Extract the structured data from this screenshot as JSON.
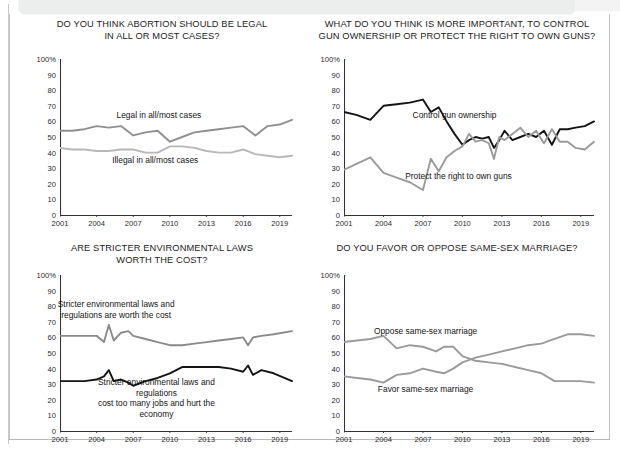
{
  "page": {
    "background_color": "#ffffff",
    "frame_color": "#c4c4c4",
    "banner_color": "#eceded"
  },
  "palette": {
    "black_series": "#141414",
    "gray_series": "#9a9a9a",
    "mid_gray_series": "#808080",
    "axis": "#333333",
    "tick_text": "#2a2a2a"
  },
  "axis": {
    "y_ticks": [
      "100%",
      "90",
      "80",
      "70",
      "60",
      "50",
      "40",
      "30",
      "20",
      "10",
      "0"
    ],
    "y_values": [
      100,
      90,
      80,
      70,
      60,
      50,
      40,
      30,
      20,
      10,
      0
    ],
    "x_ticks": [
      "2001",
      "2004",
      "2007",
      "2010",
      "2013",
      "2016",
      "2019"
    ],
    "x_values": [
      2001,
      2004,
      2007,
      2010,
      2013,
      2016,
      2019
    ]
  },
  "chart_data": [
    {
      "id": "abortion",
      "type": "line",
      "title": "DO YOU THINK ABORTION SHOULD BE LEGAL\nIN ALL OR MOST CASES?",
      "xlabel": "",
      "ylabel": "",
      "ylim": [
        0,
        100
      ],
      "xlim": [
        2001,
        2020
      ],
      "grid": false,
      "legend_position": "inline-annotation",
      "series": [
        {
          "name": "Legal in all/most cases",
          "color": "#8f8f8f",
          "label_x": 2009.1,
          "label_y": 64,
          "x": [
            2001,
            2002,
            2003,
            2004,
            2005,
            2006,
            2007,
            2008,
            2009,
            2010,
            2011,
            2012,
            2013,
            2014,
            2015,
            2016,
            2017,
            2018,
            2019,
            2020
          ],
          "y": [
            54,
            54,
            55,
            57,
            56,
            57,
            51,
            53,
            54,
            47,
            50,
            53,
            54,
            55,
            56,
            57,
            51,
            57,
            58,
            61
          ]
        },
        {
          "name": "Illegal in all/most cases",
          "color": "#b8b8b8",
          "label_x": 2008.8,
          "label_y": 35,
          "x": [
            2001,
            2002,
            2003,
            2004,
            2005,
            2006,
            2007,
            2008,
            2009,
            2010,
            2011,
            2012,
            2013,
            2014,
            2015,
            2016,
            2017,
            2018,
            2019,
            2020
          ],
          "y": [
            43,
            42,
            42,
            41,
            41,
            42,
            42,
            40,
            40,
            44,
            44,
            43,
            41,
            40,
            40,
            42,
            39,
            38,
            37,
            38
          ]
        }
      ]
    },
    {
      "id": "guns",
      "type": "line",
      "title": "WHAT DO YOU THINK IS MORE IMPORTANT, TO CONTROL\nGUN OWNERSHIP OR PROTECT THE RIGHT TO OWN GUNS?",
      "xlabel": "",
      "ylabel": "",
      "ylim": [
        0,
        100
      ],
      "xlim": [
        2001,
        2020
      ],
      "grid": false,
      "legend_position": "inline-annotation",
      "series": [
        {
          "name": "Control gun ownership",
          "color": "#141414",
          "label_x": 2009.4,
          "label_y": 64,
          "x": [
            2001,
            2002,
            2003,
            2004,
            2005,
            2006,
            2007,
            2007.6,
            2008.2,
            2008.8,
            2009.4,
            2010,
            2010.5,
            2011,
            2011.5,
            2012,
            2012.4,
            2012.8,
            2013.2,
            2013.8,
            2014.4,
            2015,
            2015.6,
            2016.2,
            2016.8,
            2017.4,
            2018,
            2018.6,
            2019.3,
            2020
          ],
          "y": [
            66,
            64,
            61,
            70,
            71,
            72,
            74,
            66,
            69,
            60,
            52,
            45,
            48,
            50,
            49,
            50,
            43,
            48,
            54,
            48,
            50,
            52,
            50,
            54,
            45,
            55,
            55,
            56,
            57,
            60
          ]
        },
        {
          "name": "Protect the right to own guns",
          "color": "#9a9a9a",
          "label_x": 2009.7,
          "label_y": 25,
          "x": [
            2001,
            2002,
            2003,
            2004,
            2005,
            2006,
            2007,
            2007.6,
            2008.2,
            2008.8,
            2009.4,
            2010,
            2010.5,
            2011,
            2011.5,
            2012,
            2012.4,
            2012.8,
            2013.2,
            2013.8,
            2014.4,
            2015,
            2015.6,
            2016.2,
            2016.8,
            2017.4,
            2018,
            2018.6,
            2019.3,
            2020
          ],
          "y": [
            29,
            33,
            37,
            27,
            24,
            21,
            16,
            36,
            28,
            37,
            41,
            44,
            52,
            47,
            48,
            46,
            36,
            50,
            48,
            52,
            56,
            50,
            54,
            46,
            55,
            47,
            47,
            43,
            42,
            47
          ]
        }
      ]
    },
    {
      "id": "environment",
      "type": "line",
      "title": "ARE STRICTER ENVIRONMENTAL LAWS\nWORTH THE COST?",
      "xlabel": "",
      "ylabel": "",
      "ylim": [
        0,
        100
      ],
      "xlim": [
        2001,
        2020
      ],
      "grid": false,
      "legend_position": "inline-annotation",
      "series": [
        {
          "name": "Stricter environmental laws and\nregulations are worth the cost",
          "color": "#8a8a8a",
          "label_x": 2005.6,
          "label_y": 78,
          "x": [
            2001,
            2002,
            2003,
            2004,
            2004.6,
            2005,
            2005.4,
            2006,
            2006.6,
            2007,
            2008,
            2009,
            2010,
            2011,
            2012,
            2013,
            2014,
            2015,
            2016,
            2016.4,
            2016.8,
            2017.5,
            2018.5,
            2020
          ],
          "y": [
            61,
            61,
            61,
            61,
            57,
            68,
            58,
            63,
            64,
            61,
            59,
            57,
            55,
            55,
            56,
            57,
            58,
            59,
            60,
            55,
            60,
            61,
            62,
            64
          ]
        },
        {
          "name": "Stricter environmental laws and regulations\ncost too many jobs and hurt the economy",
          "color": "#141414",
          "label_x": 2008.9,
          "label_y": 21,
          "x": [
            2001,
            2002,
            2003,
            2004,
            2004.6,
            2005,
            2005.4,
            2006,
            2006.6,
            2007,
            2008,
            2009,
            2010,
            2011,
            2012,
            2013,
            2014,
            2015,
            2016,
            2016.4,
            2016.8,
            2017.5,
            2018.5,
            2020
          ],
          "y": [
            32,
            32,
            32,
            33,
            35,
            39,
            32,
            33,
            31,
            29,
            32,
            34,
            37,
            41,
            41,
            41,
            41,
            40,
            38,
            42,
            36,
            39,
            37,
            32
          ]
        }
      ]
    },
    {
      "id": "samesex",
      "type": "line",
      "title": "DO YOU FAVOR OR OPPOSE SAME-SEX MARRIAGE?",
      "xlabel": "",
      "ylabel": "",
      "ylim": [
        0,
        100
      ],
      "xlim": [
        2001,
        2020
      ],
      "grid": false,
      "legend_position": "inline-annotation",
      "series": [
        {
          "name": "Oppose same-sex marriage",
          "color": "#9a9a9a",
          "label_x": 2007.2,
          "label_y": 64,
          "x": [
            2001,
            2002,
            2003,
            2004,
            2005,
            2006,
            2007,
            2008,
            2008.6,
            2009.3,
            2010,
            2011,
            2012,
            2013,
            2014,
            2015,
            2016,
            2017,
            2018,
            2019,
            2020
          ],
          "y": [
            57,
            58,
            59,
            61,
            53,
            55,
            54,
            51,
            54,
            54,
            48,
            45,
            44,
            43,
            41,
            39,
            37,
            32,
            32,
            32,
            31
          ]
        },
        {
          "name": "Favor same-sex marriage",
          "color": "#9a9a9a",
          "label_x": 2007.2,
          "label_y": 27,
          "x": [
            2001,
            2002,
            2003,
            2004,
            2005,
            2006,
            2007,
            2008,
            2008.6,
            2009.3,
            2010,
            2011,
            2012,
            2013,
            2014,
            2015,
            2016,
            2017,
            2018,
            2019,
            2020
          ],
          "y": [
            35,
            34,
            33,
            31,
            36,
            37,
            40,
            38,
            37,
            40,
            44,
            47,
            49,
            51,
            53,
            55,
            56,
            59,
            62,
            62,
            61
          ]
        }
      ]
    }
  ]
}
